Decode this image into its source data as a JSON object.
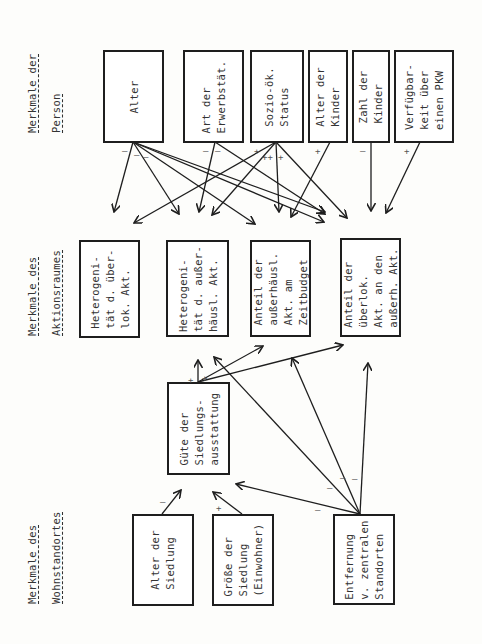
{
  "headers": {
    "person": [
      "Merkmale der",
      "Person"
    ],
    "aktionsraum": [
      "Merkmale des",
      "Aktionsraumes"
    ],
    "wohnstandort": [
      "Merkmale des",
      "Wohnstandortes"
    ]
  },
  "person_boxes": [
    {
      "id": "alter",
      "label": "Alter"
    },
    {
      "id": "erwerb",
      "label": "Art der\nErwerbstät."
    },
    {
      "id": "sozio",
      "label": "Sozio-ök.\nStatus"
    },
    {
      "id": "alter_kinder",
      "label": "Alter der\nKinder"
    },
    {
      "id": "zahl_kinder",
      "label": "Zahl der\nKinder"
    },
    {
      "id": "pkw",
      "label": "Verfügbar-\nkeit über\neinen PKW"
    }
  ],
  "aktionsraum_boxes": [
    {
      "id": "het_ueberlok",
      "label": "Heterogeni-\ntät d. über-\nlok. Akt."
    },
    {
      "id": "het_ausser",
      "label": "Heterogeni-\ntät d. außer-\nhäusl. Akt."
    },
    {
      "id": "anteil_ausser",
      "label": "Anteil der\naußerhäusl.\nAkt. am\nZeitbudget"
    },
    {
      "id": "anteil_ueberlok",
      "label": "Anteil der\nüberlok.\nAkt. an den\naußerh. Akt."
    }
  ],
  "wohnstandort_boxes": [
    {
      "id": "guete",
      "label": "Güte der\nSiedlungs-\nausstattung"
    },
    {
      "id": "alter_siedlung",
      "label": "Alter der\nSiedlung"
    },
    {
      "id": "groesse",
      "label": "Größe der\nSiedlung\n(Einwohner)"
    },
    {
      "id": "entfernung",
      "label": "Entfernung\nv. zentralen\nStandorten"
    }
  ],
  "signs": [
    {
      "x": 122,
      "y": 146,
      "t": "–"
    },
    {
      "x": 134,
      "y": 150,
      "t": "–"
    },
    {
      "x": 143,
      "y": 152,
      "t": "–"
    },
    {
      "x": 203,
      "y": 146,
      "t": "–"
    },
    {
      "x": 215,
      "y": 146,
      "t": "–"
    },
    {
      "x": 254,
      "y": 146,
      "t": "+"
    },
    {
      "x": 262,
      "y": 152,
      "t": "++"
    },
    {
      "x": 278,
      "y": 152,
      "t": "+"
    },
    {
      "x": 315,
      "y": 146,
      "t": "+"
    },
    {
      "x": 360,
      "y": 146,
      "t": "–"
    },
    {
      "x": 404,
      "y": 146,
      "t": "+"
    },
    {
      "x": 188,
      "y": 375,
      "t": "+"
    },
    {
      "x": 202,
      "y": 373,
      "t": "+"
    },
    {
      "x": 160,
      "y": 497,
      "t": "–"
    },
    {
      "x": 216,
      "y": 503,
      "t": "+"
    },
    {
      "x": 315,
      "y": 505,
      "t": "–"
    },
    {
      "x": 327,
      "y": 483,
      "t": "–"
    },
    {
      "x": 340,
      "y": 473,
      "t": "–"
    },
    {
      "x": 352,
      "y": 474,
      "t": "–"
    }
  ],
  "colors": {
    "line": "#1e1e1e",
    "paper": "#fdfdfb"
  }
}
